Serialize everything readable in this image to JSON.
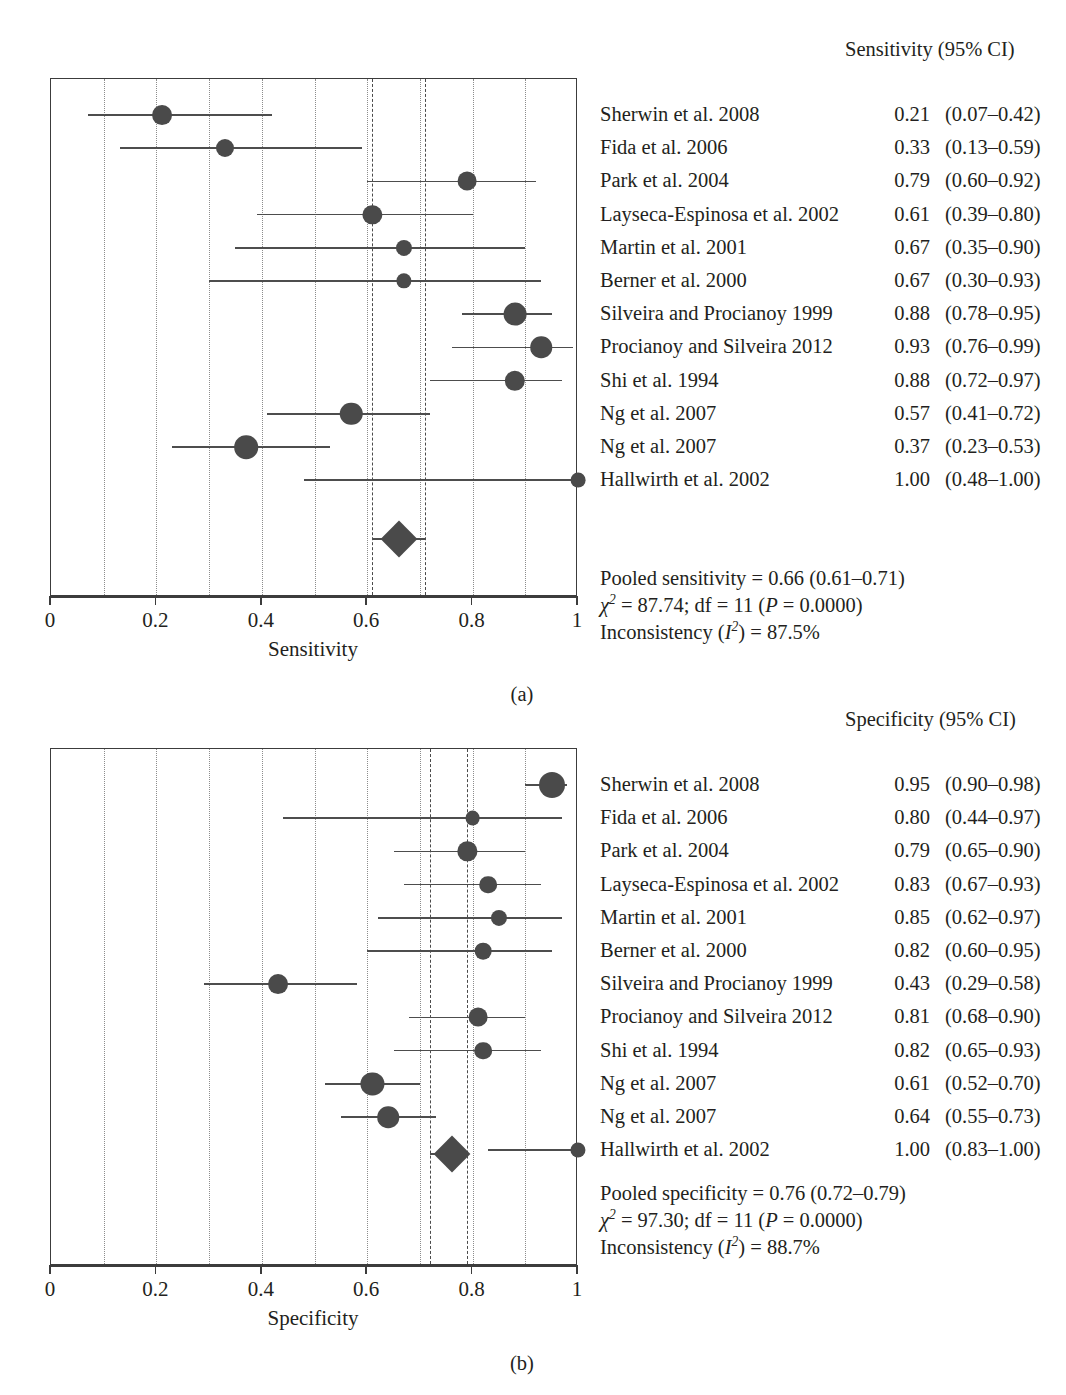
{
  "figure": {
    "panels": [
      {
        "caption": "(a)",
        "column_header": "Sensitivity (95% CI)",
        "axis_title": "Sensitivity",
        "tick_labels": [
          "0",
          "0.2",
          "0.4",
          "0.6",
          "0.8",
          "1"
        ],
        "pooled_lines": [
          "Pooled sensitivity = 0.66 (0.61–0.71)",
          "χ² = 87.74; df = 11 (P = 0.0000)",
          "Inconsistency (I²) = 87.5%"
        ],
        "studies": [
          {
            "label": "Sherwin et al. 2008",
            "est": "0.21",
            "ci": "(0.07–0.42)"
          },
          {
            "label": "Fida et al. 2006",
            "est": "0.33",
            "ci": "(0.13–0.59)"
          },
          {
            "label": "Park et al. 2004",
            "est": "0.79",
            "ci": "(0.60–0.92)"
          },
          {
            "label": "Layseca-Espinosa et al. 2002",
            "est": "0.61",
            "ci": "(0.39–0.80)"
          },
          {
            "label": "Martin et al. 2001",
            "est": "0.67",
            "ci": "(0.35–0.90)"
          },
          {
            "label": "Berner et al. 2000",
            "est": "0.67",
            "ci": "(0.30–0.93)"
          },
          {
            "label": "Silveira and Procianoy 1999",
            "est": "0.88",
            "ci": "(0.78–0.95)"
          },
          {
            "label": "Procianoy and Silveira 2012",
            "est": "0.93",
            "ci": "(0.76–0.99)"
          },
          {
            "label": "Shi et al. 1994",
            "est": "0.88",
            "ci": "(0.72–0.97)"
          },
          {
            "label": "Ng et al. 2007",
            "est": "0.57",
            "ci": "(0.41–0.72)"
          },
          {
            "label": "Ng et al. 2007",
            "est": "0.37",
            "ci": "(0.23–0.53)"
          },
          {
            "label": "Hallwirth et al. 2002",
            "est": "1.00",
            "ci": "(0.48–1.00)"
          }
        ]
      },
      {
        "caption": "(b)",
        "column_header": "Specificity (95% CI)",
        "axis_title": "Specificity",
        "tick_labels": [
          "0",
          "0.2",
          "0.4",
          "0.6",
          "0.8",
          "1"
        ],
        "pooled_lines": [
          "Pooled specificity = 0.76 (0.72–0.79)",
          "χ² = 97.30; df = 11 (P = 0.0000)",
          "Inconsistency (I²) = 88.7%"
        ],
        "studies": [
          {
            "label": "Sherwin et al. 2008",
            "est": "0.95",
            "ci": "(0.90–0.98)"
          },
          {
            "label": "Fida et al. 2006",
            "est": "0.80",
            "ci": "(0.44–0.97)"
          },
          {
            "label": "Park et al. 2004",
            "est": "0.79",
            "ci": "(0.65–0.90)"
          },
          {
            "label": "Layseca-Espinosa et al. 2002",
            "est": "0.83",
            "ci": "(0.67–0.93)"
          },
          {
            "label": "Martin et al. 2001",
            "est": "0.85",
            "ci": "(0.62–0.97)"
          },
          {
            "label": "Berner et al. 2000",
            "est": "0.82",
            "ci": "(0.60–0.95)"
          },
          {
            "label": "Silveira and Procianoy 1999",
            "est": "0.43",
            "ci": "(0.29–0.58)"
          },
          {
            "label": "Procianoy and Silveira 2012",
            "est": "0.81",
            "ci": "(0.68–0.90)"
          },
          {
            "label": "Shi et al. 1994",
            "est": "0.82",
            "ci": "(0.65–0.93)"
          },
          {
            "label": "Ng et al. 2007",
            "est": "0.61",
            "ci": "(0.52–0.70)"
          },
          {
            "label": "Ng et al. 2007",
            "est": "0.64",
            "ci": "(0.55–0.73)"
          },
          {
            "label": "Hallwirth et al. 2002",
            "est": "1.00",
            "ci": "(0.83–1.00)"
          }
        ]
      }
    ]
  },
  "chart_data": [
    {
      "type": "forest",
      "title": "Sensitivity (95% CI)",
      "xlabel": "Sensitivity",
      "ylabel": "",
      "xlim": [
        0,
        1
      ],
      "xticks": [
        0,
        0.2,
        0.4,
        0.6,
        0.8,
        1
      ],
      "gridlines": [
        0.1,
        0.2,
        0.3,
        0.4,
        0.5,
        0.6,
        0.7,
        0.8,
        0.9
      ],
      "grid": true,
      "legend": "none",
      "reference_lines": [
        0.61,
        0.71
      ],
      "pooled": {
        "estimate": 0.66,
        "ci_low": 0.61,
        "ci_high": 0.71,
        "chi2": 87.74,
        "df": 11,
        "p": "0.0000",
        "I2_percent": 87.5
      },
      "studies": [
        {
          "label": "Sherwin et al. 2008",
          "estimate": 0.21,
          "ci_low": 0.07,
          "ci_high": 0.42,
          "weight": 0.62
        },
        {
          "label": "Fida et al. 2006",
          "estimate": 0.33,
          "ci_low": 0.13,
          "ci_high": 0.59,
          "weight": 0.5
        },
        {
          "label": "Park et al. 2004",
          "estimate": 0.79,
          "ci_low": 0.6,
          "ci_high": 0.92,
          "weight": 0.55
        },
        {
          "label": "Layseca-Espinosa et al. 2002",
          "estimate": 0.61,
          "ci_low": 0.39,
          "ci_high": 0.8,
          "weight": 0.58
        },
        {
          "label": "Martin et al. 2001",
          "estimate": 0.67,
          "ci_low": 0.35,
          "ci_high": 0.9,
          "weight": 0.38
        },
        {
          "label": "Berner et al. 2000",
          "estimate": 0.67,
          "ci_low": 0.3,
          "ci_high": 0.93,
          "weight": 0.33
        },
        {
          "label": "Silveira and Procianoy 1999",
          "estimate": 0.88,
          "ci_low": 0.78,
          "ci_high": 0.95,
          "weight": 0.8
        },
        {
          "label": "Procianoy and Silveira 2012",
          "estimate": 0.93,
          "ci_low": 0.76,
          "ci_high": 0.99,
          "weight": 0.72
        },
        {
          "label": "Shi et al. 1994",
          "estimate": 0.88,
          "ci_low": 0.72,
          "ci_high": 0.97,
          "weight": 0.65
        },
        {
          "label": "Ng et al. 2007",
          "estimate": 0.57,
          "ci_low": 0.41,
          "ci_high": 0.72,
          "weight": 0.78
        },
        {
          "label": "Ng et al. 2007",
          "estimate": 0.37,
          "ci_low": 0.23,
          "ci_high": 0.53,
          "weight": 0.85
        },
        {
          "label": "Hallwirth et al. 2002",
          "estimate": 1.0,
          "ci_low": 0.48,
          "ci_high": 1.0,
          "weight": 0.3
        }
      ]
    },
    {
      "type": "forest",
      "title": "Specificity (95% CI)",
      "xlabel": "Specificity",
      "ylabel": "",
      "xlim": [
        0,
        1
      ],
      "xticks": [
        0,
        0.2,
        0.4,
        0.6,
        0.8,
        1
      ],
      "gridlines": [
        0.1,
        0.2,
        0.3,
        0.4,
        0.5,
        0.6,
        0.7,
        0.8,
        0.9
      ],
      "grid": true,
      "legend": "none",
      "reference_lines": [
        0.72,
        0.79
      ],
      "pooled": {
        "estimate": 0.76,
        "ci_low": 0.72,
        "ci_high": 0.79,
        "chi2": 97.3,
        "df": 11,
        "p": "0.0000",
        "I2_percent": 88.7
      },
      "studies": [
        {
          "label": "Sherwin et al. 2008",
          "estimate": 0.95,
          "ci_low": 0.9,
          "ci_high": 0.98,
          "weight": 1.0
        },
        {
          "label": "Fida et al. 2006",
          "estimate": 0.8,
          "ci_low": 0.44,
          "ci_high": 0.97,
          "weight": 0.3
        },
        {
          "label": "Park et al. 2004",
          "estimate": 0.79,
          "ci_low": 0.65,
          "ci_high": 0.9,
          "weight": 0.58
        },
        {
          "label": "Layseca-Espinosa et al. 2002",
          "estimate": 0.83,
          "ci_low": 0.67,
          "ci_high": 0.93,
          "weight": 0.48
        },
        {
          "label": "Martin et al. 2001",
          "estimate": 0.85,
          "ci_low": 0.62,
          "ci_high": 0.97,
          "weight": 0.38
        },
        {
          "label": "Berner et al. 2000",
          "estimate": 0.82,
          "ci_low": 0.6,
          "ci_high": 0.95,
          "weight": 0.42
        },
        {
          "label": "Silveira and Procianoy 1999",
          "estimate": 0.43,
          "ci_low": 0.29,
          "ci_high": 0.58,
          "weight": 0.62
        },
        {
          "label": "Procianoy and Silveira 2012",
          "estimate": 0.81,
          "ci_low": 0.68,
          "ci_high": 0.9,
          "weight": 0.55
        },
        {
          "label": "Shi et al. 1994",
          "estimate": 0.82,
          "ci_low": 0.65,
          "ci_high": 0.93,
          "weight": 0.48
        },
        {
          "label": "Ng et al. 2007",
          "estimate": 0.61,
          "ci_low": 0.52,
          "ci_high": 0.7,
          "weight": 0.82
        },
        {
          "label": "Ng et al. 2007",
          "estimate": 0.64,
          "ci_low": 0.55,
          "ci_high": 0.73,
          "weight": 0.72
        },
        {
          "label": "Hallwirth et al. 2002",
          "estimate": 1.0,
          "ci_low": 0.83,
          "ci_high": 1.0,
          "weight": 0.32
        }
      ]
    }
  ]
}
